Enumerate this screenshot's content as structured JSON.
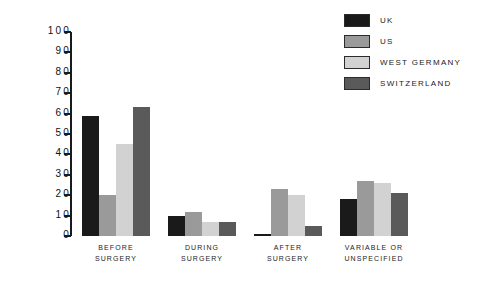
{
  "chart_data": {
    "type": "bar",
    "title": "",
    "subtitle": "",
    "xlabel": "",
    "ylabel": "",
    "ylim": [
      0,
      100
    ],
    "ytick_labels": [
      "100",
      "90",
      "80",
      "70",
      "60",
      "50",
      "40",
      "30",
      "20",
      "10",
      "0"
    ],
    "ytick_values": [
      100,
      90,
      80,
      70,
      60,
      50,
      40,
      30,
      20,
      10,
      0
    ],
    "grid": false,
    "legend_position": "top-right",
    "categories": [
      "BEFORE SURGERY",
      "DURING SURGERY",
      "AFTER SURGERY",
      "VARIABLE OR UNSPECIFIED"
    ],
    "category_lines": [
      [
        "BEFORE",
        "SURGERY"
      ],
      [
        "DURING",
        "SURGERY"
      ],
      [
        "AFTER",
        "SURGERY"
      ],
      [
        "VARIABLE OR",
        "UNSPECIFIED"
      ]
    ],
    "series": [
      {
        "name": "UK",
        "color": "#1a1a1a",
        "values": [
          59,
          10,
          1,
          18
        ]
      },
      {
        "name": "US",
        "color": "#9a9a9a",
        "values": [
          20,
          12,
          23,
          27
        ]
      },
      {
        "name": "WEST GERMANY",
        "color": "#d2d2d2",
        "values": [
          45,
          7,
          20,
          26
        ]
      },
      {
        "name": "SWITZERLAND",
        "color": "#5a5a5a",
        "values": [
          63,
          7,
          5,
          21
        ]
      }
    ]
  },
  "legend": {
    "items": [
      {
        "label": "UK",
        "color": "#1a1a1a"
      },
      {
        "label": "US",
        "color": "#9a9a9a"
      },
      {
        "label": "WEST GERMANY",
        "color": "#d2d2d2"
      },
      {
        "label": "SWITZERLAND",
        "color": "#5a5a5a"
      }
    ]
  }
}
